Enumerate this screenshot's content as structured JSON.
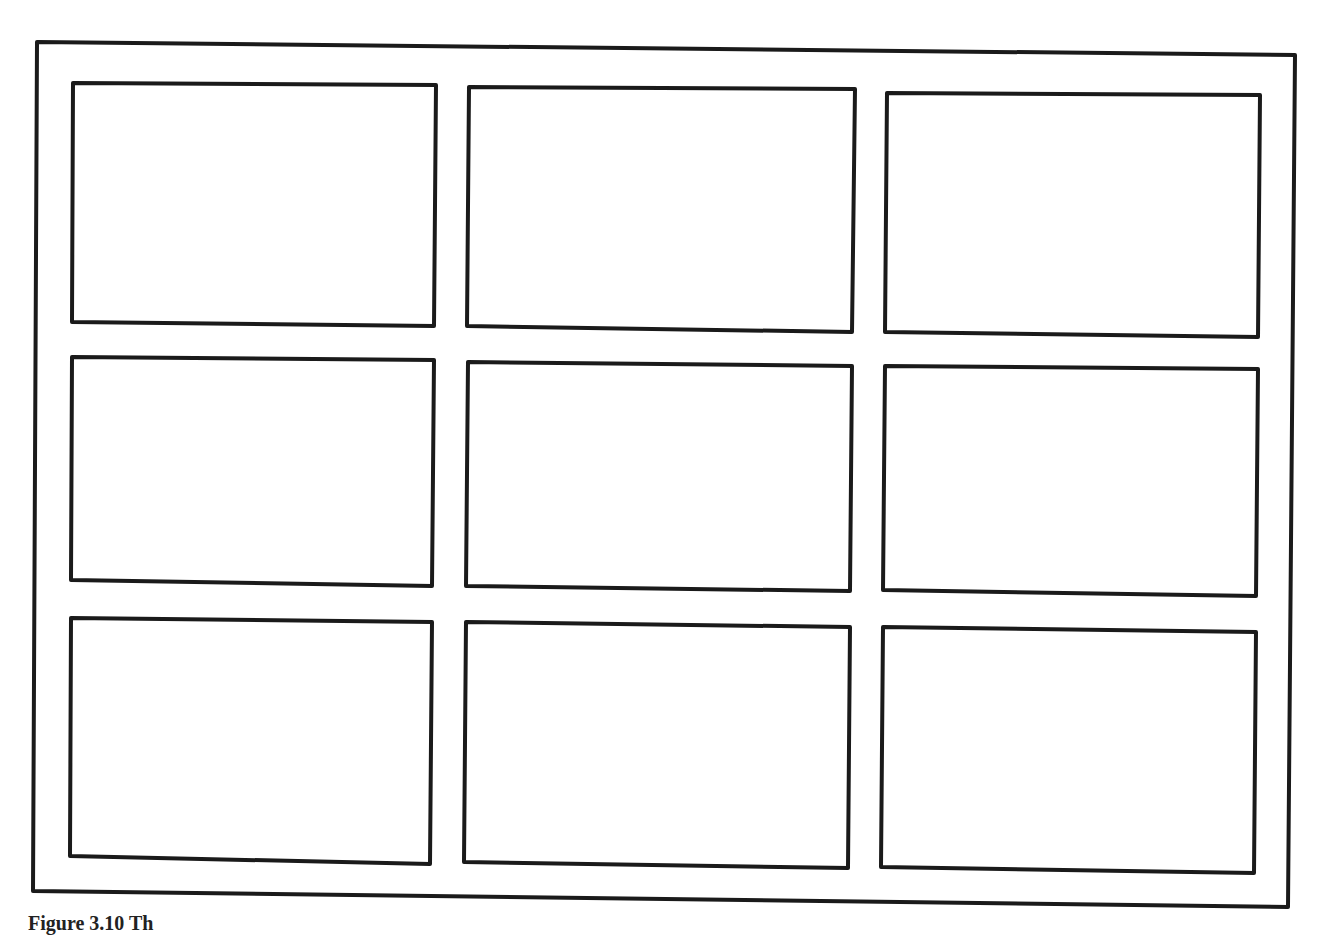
{
  "diagram": {
    "stroke_color": "#1a1a1a",
    "background": "#ffffff",
    "outer_frame": {
      "points": [
        [
          37,
          42
        ],
        [
          1295,
          55
        ],
        [
          1288,
          907
        ],
        [
          33,
          891
        ]
      ]
    },
    "rows": 3,
    "columns": 3,
    "cells": [
      {
        "id": "r1c1",
        "points": [
          [
            73,
            83
          ],
          [
            436,
            85
          ],
          [
            434,
            326
          ],
          [
            72,
            322
          ]
        ]
      },
      {
        "id": "r1c2",
        "points": [
          [
            469,
            87
          ],
          [
            855,
            89
          ],
          [
            852,
            332
          ],
          [
            467,
            326
          ]
        ]
      },
      {
        "id": "r1c3",
        "points": [
          [
            887,
            93
          ],
          [
            1260,
            95
          ],
          [
            1258,
            337
          ],
          [
            885,
            332
          ]
        ]
      },
      {
        "id": "r2c1",
        "points": [
          [
            72,
            357
          ],
          [
            434,
            360
          ],
          [
            432,
            586
          ],
          [
            71,
            580
          ]
        ]
      },
      {
        "id": "r2c2",
        "points": [
          [
            468,
            362
          ],
          [
            852,
            366
          ],
          [
            850,
            591
          ],
          [
            466,
            586
          ]
        ]
      },
      {
        "id": "r2c3",
        "points": [
          [
            885,
            366
          ],
          [
            1258,
            369
          ],
          [
            1256,
            596
          ],
          [
            883,
            590
          ]
        ]
      },
      {
        "id": "r3c1",
        "points": [
          [
            71,
            618
          ],
          [
            432,
            622
          ],
          [
            430,
            864
          ],
          [
            70,
            856
          ]
        ]
      },
      {
        "id": "r3c2",
        "points": [
          [
            466,
            622
          ],
          [
            850,
            627
          ],
          [
            848,
            868
          ],
          [
            464,
            862
          ]
        ]
      },
      {
        "id": "r3c3",
        "points": [
          [
            883,
            627
          ],
          [
            1256,
            632
          ],
          [
            1254,
            873
          ],
          [
            881,
            867
          ]
        ]
      }
    ]
  },
  "caption": {
    "text": "Figure 3.10  Th"
  }
}
